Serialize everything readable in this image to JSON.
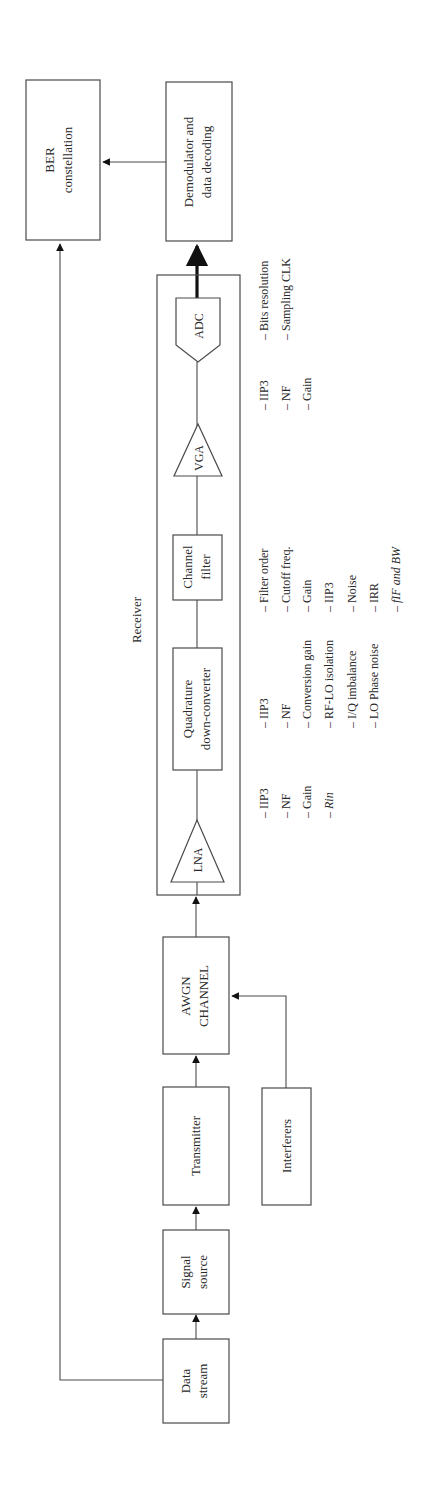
{
  "diagram": {
    "orientation": "rotated-90-ccw",
    "title_receiver": "Receiver",
    "blocks": {
      "data_stream": [
        "Data",
        "stream"
      ],
      "signal_source": [
        "Signal",
        "source"
      ],
      "transmitter": [
        "Transmitter"
      ],
      "interferers": [
        "Interferers"
      ],
      "awgn_channel": [
        "AWGN",
        "CHANNEL"
      ],
      "lna": "LNA",
      "quadrature": [
        "Quadrature",
        "down-converter"
      ],
      "channel_filter": [
        "Channel",
        "filter"
      ],
      "vga": "VGA",
      "adc": "ADC",
      "demodulator": [
        "Demodulator and",
        "data decoding"
      ],
      "ber": [
        "BER",
        "constellation"
      ]
    },
    "params": {
      "lna": [
        "– IIP3",
        "– NF",
        "– Gain",
        "– Rin"
      ],
      "quadrature": [
        "– IIP3",
        "– NF",
        "– Conversion gain",
        "– RF-LO isolation",
        "– I/Q imbalance",
        "– LO Phase noise"
      ],
      "channel_filter": [
        "– Filter order",
        "– Cutoff freq.",
        "– Gain",
        "– IIP3",
        "– Noise",
        "– IRR",
        "– fIF and BW"
      ],
      "vga": [
        "– IIP3",
        "– NF",
        "– Gain"
      ],
      "adc": [
        "– Bits resolution",
        "– Sampling CLK"
      ]
    },
    "connections": [
      {
        "from": "Data stream",
        "to": "Signal source"
      },
      {
        "from": "Signal source",
        "to": "Transmitter"
      },
      {
        "from": "Transmitter",
        "to": "AWGN CHANNEL"
      },
      {
        "from": "Interferers",
        "to": "AWGN CHANNEL"
      },
      {
        "from": "AWGN CHANNEL",
        "to": "LNA"
      },
      {
        "from": "LNA",
        "to": "Quadrature down-converter"
      },
      {
        "from": "Quadrature down-converter",
        "to": "Channel filter"
      },
      {
        "from": "Channel filter",
        "to": "VGA"
      },
      {
        "from": "VGA",
        "to": "ADC"
      },
      {
        "from": "ADC",
        "to": "Demodulator and data decoding"
      },
      {
        "from": "Demodulator and data decoding",
        "to": "BER constellation"
      },
      {
        "from": "Data stream",
        "to": "BER constellation"
      }
    ]
  }
}
